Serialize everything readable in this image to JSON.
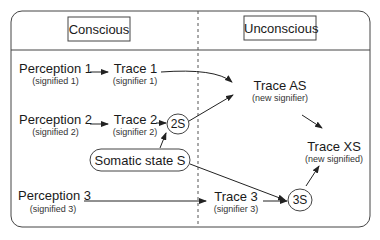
{
  "headers": {
    "left": "Conscious",
    "right": "Unconscious"
  },
  "nodes": {
    "perception1": {
      "label": "Perception 1",
      "sub": "(signified 1)"
    },
    "trace1": {
      "label": "Trace 1",
      "sub": "(signifier 1)"
    },
    "perception2": {
      "label": "Perception 2",
      "sub": "(signified 2)"
    },
    "trace2": {
      "label": "Trace 2",
      "sub": "(signifier 2)"
    },
    "node2s": {
      "label": "2S"
    },
    "somatic": {
      "label": "Somatic state S"
    },
    "perception3": {
      "label": "Perception 3",
      "sub": "(signified 3)"
    },
    "trace3": {
      "label": "Trace 3",
      "sub": "(signifier 3)"
    },
    "node3s": {
      "label": "3S"
    },
    "traceAS": {
      "label": "Trace AS",
      "sub": "(new signifier)"
    },
    "traceXS": {
      "label": "Trace XS",
      "sub": "(new signified)"
    }
  },
  "colors": {
    "line": "#333333",
    "background": "#ffffff"
  }
}
